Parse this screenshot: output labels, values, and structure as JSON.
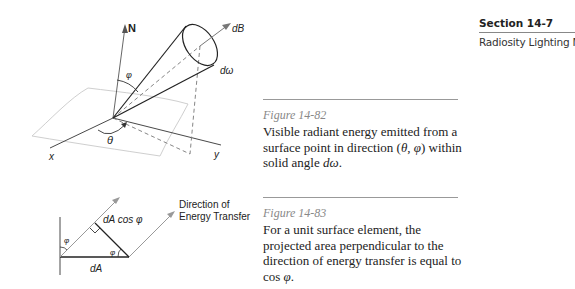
{
  "section": {
    "title": "Section 14-7",
    "subtitle": "Radiosity Lighting Model"
  },
  "figures": [
    {
      "label": "Figure 14-82",
      "caption_part1": "Visible radiant energy emitted from a surface point in direction (",
      "caption_theta": "θ",
      "caption_sep": ", ",
      "caption_phi": "φ",
      "caption_part2": ") within solid angle ",
      "caption_domega": "dω",
      "caption_end": ".",
      "diagram_labels": {
        "normal": "N",
        "beam": "dB",
        "solid_angle": "dω",
        "polar_angle": "φ",
        "azimuth_angle": "θ",
        "x_axis": "x",
        "y_axis": "y"
      }
    },
    {
      "label": "Figure 14-83",
      "caption_part1": "For a unit surface element, the projected area perpendicular to the direction of energy transfer is equal to cos ",
      "caption_phi": "φ",
      "caption_end": ".",
      "diagram_labels": {
        "direction_line1": "Direction of",
        "direction_line2": "Energy Transfer",
        "projected": "dA cos φ",
        "area": "dA",
        "angle_left": "φ",
        "angle_right": "φ"
      }
    }
  ]
}
